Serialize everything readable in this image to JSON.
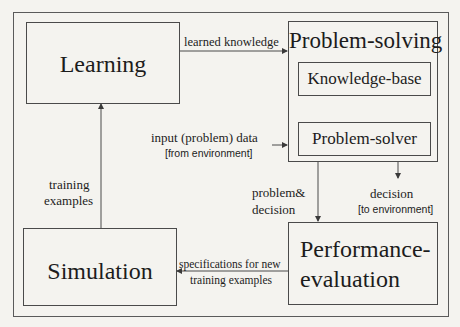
{
  "diagram": {
    "nodes": {
      "learning": "Learning",
      "problem_solving": "Problem-solving",
      "knowledge_base": "Knowledge-base",
      "problem_solver": "Problem-solver",
      "simulation": "Simulation",
      "performance_line1": "Performance-",
      "performance_line2": "evaluation"
    },
    "edges": {
      "learned_knowledge": "learned knowledge",
      "input_data": "input (problem) data",
      "input_source": "[from environment]",
      "problem_decision_line1": "problem&",
      "problem_decision_line2": "decision",
      "decision": "decision",
      "decision_target": "[to environment]",
      "specs_line1": "specifications for new",
      "specs_line2": "training examples",
      "training_line1": "training",
      "training_line2": "examples"
    },
    "colors": {
      "background": "#f4f3ef",
      "line": "#4a4a4a",
      "text": "#1c1c1c"
    }
  }
}
